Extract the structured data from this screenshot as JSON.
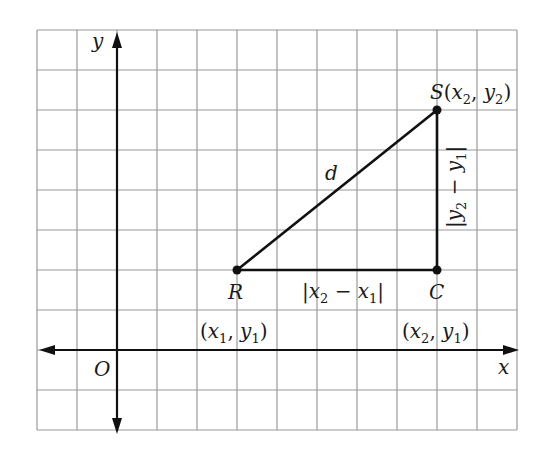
{
  "diagram": {
    "colors": {
      "grid": "#9a9a9a",
      "axis": "#111111",
      "segment": "#111111",
      "background": "#ffffff"
    },
    "grid": {
      "left": 37,
      "top": 30,
      "cell": 40,
      "cols": 12,
      "rows": 10
    },
    "axes": {
      "x_label": "x",
      "y_label": "y",
      "origin_label": "O"
    },
    "points": {
      "R": {
        "name": "R",
        "coords": "(x1, y1)"
      },
      "S": {
        "name": "S",
        "coords": "(x2, y2)"
      },
      "C": {
        "name": "C",
        "coords": "(x2, y1)"
      }
    },
    "segments": {
      "hypotenuse": "d",
      "horizontal": "|x2 − x1|",
      "vertical": "|y2 − y1|"
    },
    "text": {
      "S_letter": "S",
      "paren_open": "(",
      "paren_close": ")",
      "comma": ", ",
      "x": "x",
      "y": "y",
      "sub1": "1",
      "sub2": "2",
      "bar": "|",
      "minus": " − "
    }
  }
}
